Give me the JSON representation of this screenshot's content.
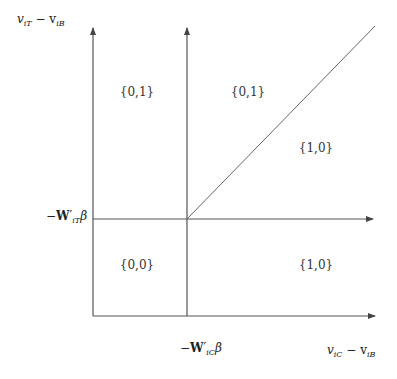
{
  "axes": {
    "y_label": "v_iT − v_iB",
    "x_label": "v_iC − v_iB",
    "y_threshold_label": "−W′_iT β",
    "x_threshold_label": "−W′_iC β"
  },
  "labels": {
    "y_label_main": "v",
    "y_label_sub1": "iT",
    "y_label_mid": " − v",
    "y_label_sub2": "iB",
    "x_label_main": "v",
    "x_label_sub1": "iC",
    "x_label_mid": " − v",
    "x_label_sub2": "iB",
    "y_thr_minus": "−",
    "y_thr_W": "W",
    "y_thr_prime": "′",
    "y_thr_sub": "iT",
    "y_thr_beta": "β",
    "x_thr_minus": "−",
    "x_thr_W": "W",
    "x_thr_prime": "′",
    "x_thr_sub": "iC",
    "x_thr_beta": "β"
  },
  "regions": [
    {
      "label": "{0,1}",
      "position": "upper-left"
    },
    {
      "label": "{0,1}",
      "position": "upper-middle"
    },
    {
      "label": "{1,0}",
      "position": "upper-right"
    },
    {
      "label": "{0,0}",
      "position": "lower-left"
    },
    {
      "label": "{1,0}",
      "position": "lower-right"
    }
  ],
  "colors": {
    "line": "#555555",
    "text": "#222222"
  }
}
